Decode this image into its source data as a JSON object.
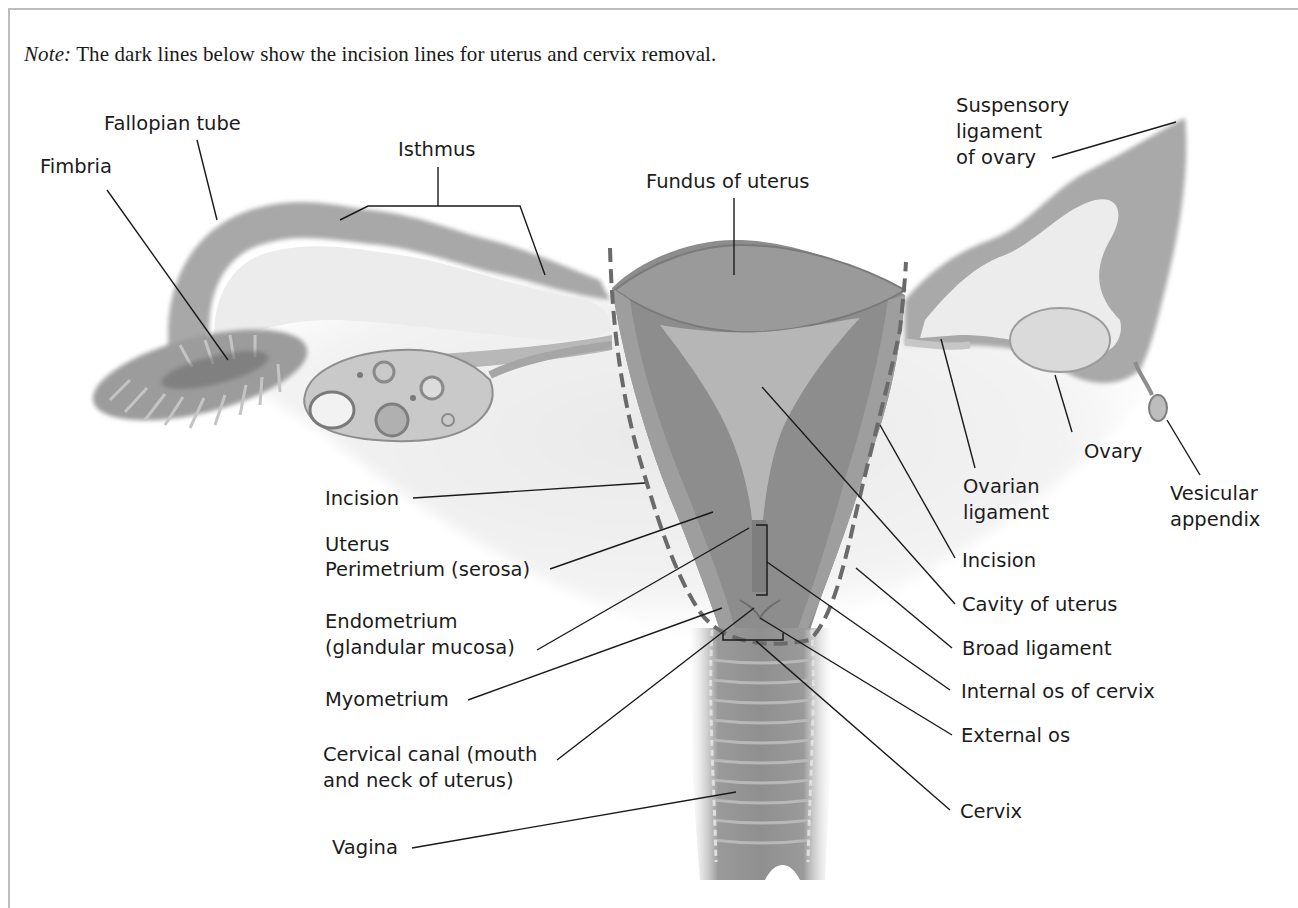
{
  "note": {
    "prefix": "Note:",
    "text": " The dark lines below show the incision lines for uterus and cervix removal."
  },
  "labels": {
    "fallopian_tube": "Fallopian tube",
    "fimbria": "Fimbria",
    "isthmus": "Isthmus",
    "fundus": "Fundus of uterus",
    "suspensory_1": "Suspensory",
    "suspensory_2": "ligament",
    "suspensory_3": "of ovary",
    "incision_left": "Incision",
    "uterus": "Uterus",
    "perimetrium": "Perimetrium (serosa)",
    "endometrium_1": "Endometrium",
    "endometrium_2": "(glandular mucosa)",
    "myometrium": "Myometrium",
    "cervical_canal_1": "Cervical canal (mouth",
    "cervical_canal_2": "and neck of uterus)",
    "vagina": "Vagina",
    "ovary": "Ovary",
    "ovarian_ligament_1": "Ovarian",
    "ovarian_ligament_2": "ligament",
    "vesicular_1": "Vesicular",
    "vesicular_2": "appendix",
    "incision_right": "Incision",
    "cavity": "Cavity of uterus",
    "broad_ligament": "Broad ligament",
    "internal_os": "Internal os of cervix",
    "external_os": "External os",
    "cervix": "Cervix"
  },
  "colors": {
    "tissue_dark": "#7d7d7d",
    "tissue_mid": "#a3a3a3",
    "tissue_light": "#d4d4d4",
    "incision_line": "#5a5a5a",
    "leader_line": "#1a1a1a",
    "label_text": "#1c1c1c"
  }
}
